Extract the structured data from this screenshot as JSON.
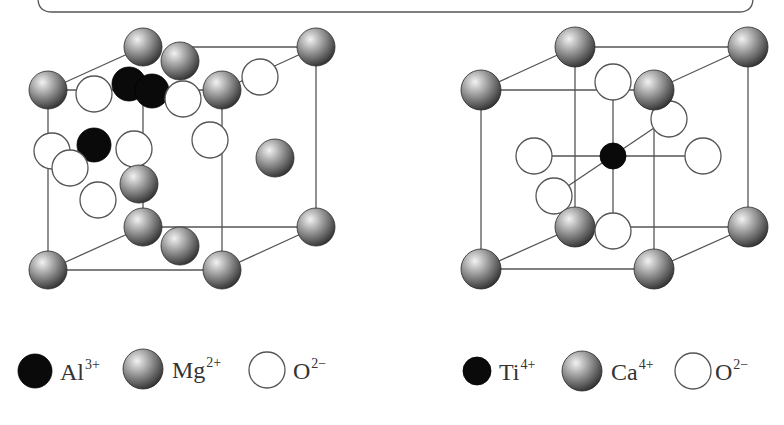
{
  "banner": {
    "box": {
      "x1": 38,
      "x2": 753,
      "bottom": 12,
      "radius": 14,
      "stroke": "#555555"
    }
  },
  "colors": {
    "edge": "#555555",
    "cation_dark": "#0a0a0a",
    "sphere_light": "#f2f2f2",
    "sphere_mid": "#9a9a9a",
    "sphere_dark": "#3a3a3a",
    "oxygen_fill": "#ffffff",
    "text": "#333333"
  },
  "spinel": {
    "name": "MgAl2O4 spinel structure (partial cell)",
    "edges": [
      [
        48,
        90,
        48,
        270
      ],
      [
        222,
        90,
        222,
        270
      ],
      [
        143,
        84,
        143,
        227
      ],
      [
        316,
        47,
        316,
        227
      ],
      [
        48,
        270,
        222,
        270
      ],
      [
        143,
        227,
        316,
        227
      ],
      [
        48,
        270,
        143,
        227
      ],
      [
        222,
        270,
        316,
        227
      ],
      [
        48,
        90,
        143,
        47
      ],
      [
        48,
        90,
        222,
        90
      ],
      [
        180,
        47,
        316,
        47
      ],
      [
        222,
        90,
        316,
        47
      ]
    ],
    "mg": [
      [
        143,
        47
      ],
      [
        180,
        61
      ],
      [
        316,
        47
      ],
      [
        48,
        90
      ],
      [
        222,
        90
      ],
      [
        275,
        158
      ],
      [
        139,
        184
      ],
      [
        143,
        227
      ],
      [
        316,
        227
      ],
      [
        180,
        246
      ],
      [
        48,
        270
      ],
      [
        222,
        270
      ]
    ],
    "al": [
      [
        129,
        84
      ],
      [
        152,
        91
      ],
      [
        94,
        145
      ]
    ],
    "o": [
      [
        94,
        94
      ],
      [
        183,
        99
      ],
      [
        260,
        77
      ],
      [
        52,
        151
      ],
      [
        134,
        149
      ],
      [
        210,
        140
      ],
      [
        70,
        168
      ],
      [
        98,
        200
      ]
    ],
    "order": [
      {
        "t": "mg",
        "i": 0
      },
      {
        "t": "mg",
        "i": 2
      },
      {
        "t": "mg",
        "i": 1
      },
      {
        "t": "o",
        "i": 2
      },
      {
        "t": "mg",
        "i": 3
      },
      {
        "t": "o",
        "i": 0
      },
      {
        "t": "al",
        "i": 0
      },
      {
        "t": "al",
        "i": 1
      },
      {
        "t": "o",
        "i": 1
      },
      {
        "t": "mg",
        "i": 4
      },
      {
        "t": "o",
        "i": 5
      },
      {
        "t": "mg",
        "i": 5
      },
      {
        "t": "o",
        "i": 3
      },
      {
        "t": "al",
        "i": 2
      },
      {
        "t": "o",
        "i": 4
      },
      {
        "t": "o",
        "i": 6
      },
      {
        "t": "o",
        "i": 7
      },
      {
        "t": "mg",
        "i": 6
      },
      {
        "t": "mg",
        "i": 8
      },
      {
        "t": "mg",
        "i": 7
      },
      {
        "t": "mg",
        "i": 9
      },
      {
        "t": "mg",
        "i": 10
      },
      {
        "t": "mg",
        "i": 11
      }
    ],
    "radius": {
      "mg": 19,
      "al": 17,
      "o": 18
    }
  },
  "perovskite": {
    "name": "CaTiO3 perovskite structure",
    "edges": [
      [
        481,
        90,
        481,
        269
      ],
      [
        654,
        90,
        654,
        269
      ],
      [
        575,
        47,
        575,
        227
      ],
      [
        748,
        47,
        748,
        227
      ],
      [
        481,
        90,
        654,
        90
      ],
      [
        575,
        47,
        748,
        47
      ],
      [
        481,
        269,
        654,
        269
      ],
      [
        575,
        227,
        748,
        227
      ],
      [
        481,
        90,
        575,
        47
      ],
      [
        654,
        90,
        748,
        47
      ],
      [
        481,
        269,
        575,
        227
      ],
      [
        654,
        269,
        748,
        227
      ],
      [
        552,
        156,
        685,
        156
      ],
      [
        613,
        100,
        613,
        213
      ],
      [
        568,
        186,
        654,
        128
      ]
    ],
    "ca": [
      [
        575,
        47
      ],
      [
        748,
        47
      ],
      [
        481,
        90
      ],
      [
        654,
        90
      ],
      [
        575,
        227
      ],
      [
        748,
        227
      ],
      [
        481,
        269
      ],
      [
        654,
        269
      ]
    ],
    "ti": [
      [
        613,
        156
      ]
    ],
    "o": [
      [
        613,
        82
      ],
      [
        669,
        119
      ],
      [
        534,
        156
      ],
      [
        703,
        156
      ],
      [
        554,
        196
      ],
      [
        613,
        231
      ]
    ],
    "order": [
      {
        "t": "ca",
        "i": 0
      },
      {
        "t": "ca",
        "i": 1
      },
      {
        "t": "o",
        "i": 0
      },
      {
        "t": "o",
        "i": 1
      },
      {
        "t": "ca",
        "i": 2
      },
      {
        "t": "ca",
        "i": 3
      },
      {
        "t": "o",
        "i": 2
      },
      {
        "t": "o",
        "i": 3
      },
      {
        "t": "ti",
        "i": 0
      },
      {
        "t": "o",
        "i": 4
      },
      {
        "t": "ca",
        "i": 4
      },
      {
        "t": "o",
        "i": 5
      },
      {
        "t": "ca",
        "i": 5
      },
      {
        "t": "ca",
        "i": 6
      },
      {
        "t": "ca",
        "i": 7
      }
    ],
    "radius": {
      "ca": 20,
      "ti": 13,
      "o": 18
    }
  },
  "legend_left": {
    "items": [
      {
        "kind": "cation",
        "cx": 35,
        "cy": 371,
        "r": 17,
        "symbol": "Al",
        "charge": "3+",
        "tx": 60
      },
      {
        "kind": "sphere",
        "cx": 143,
        "cy": 369,
        "r": 20,
        "symbol": "Mg",
        "charge": "2+",
        "tx": 172
      },
      {
        "kind": "oxygen",
        "cx": 267,
        "cy": 370,
        "r": 18,
        "symbol": "O",
        "charge": "2−",
        "tx": 293
      }
    ]
  },
  "legend_right": {
    "items": [
      {
        "kind": "cation",
        "cx": 477,
        "cy": 371,
        "r": 14,
        "symbol": "Ti",
        "charge": "4+",
        "tx": 499
      },
      {
        "kind": "sphere",
        "cx": 582,
        "cy": 371,
        "r": 20,
        "symbol": "Ca",
        "charge": "4+",
        "tx": 611
      },
      {
        "kind": "oxygen",
        "cx": 693,
        "cy": 371,
        "r": 18,
        "symbol": "O",
        "charge": "2−",
        "tx": 715
      }
    ]
  }
}
